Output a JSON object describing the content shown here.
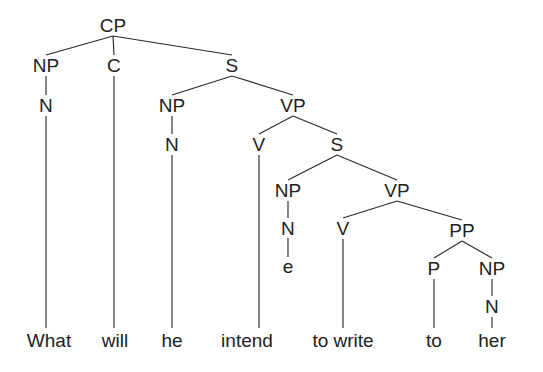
{
  "figure": {
    "kind": "syntax-tree",
    "sentence": "What will he intend to write to her",
    "line_color": "#2a2a2a",
    "text_color": "#222222",
    "background_color": "#ffffff"
  },
  "nodes": [
    {
      "id": "cp",
      "label": "CP",
      "x": 113,
      "y": 25
    },
    {
      "id": "np1",
      "label": "NP",
      "x": 46,
      "y": 65
    },
    {
      "id": "c",
      "label": "C",
      "x": 114,
      "y": 65
    },
    {
      "id": "s1",
      "label": "S",
      "x": 232,
      "y": 65
    },
    {
      "id": "n1",
      "label": "N",
      "x": 46,
      "y": 105
    },
    {
      "id": "np2",
      "label": "NP",
      "x": 172,
      "y": 105
    },
    {
      "id": "vp1",
      "label": "VP",
      "x": 293,
      "y": 105
    },
    {
      "id": "n2",
      "label": "N",
      "x": 172,
      "y": 144
    },
    {
      "id": "v1",
      "label": "V",
      "x": 259,
      "y": 144
    },
    {
      "id": "s2",
      "label": "S",
      "x": 337,
      "y": 144
    },
    {
      "id": "np3",
      "label": "NP",
      "x": 288,
      "y": 190
    },
    {
      "id": "vp2",
      "label": "VP",
      "x": 397,
      "y": 190
    },
    {
      "id": "n3",
      "label": "N",
      "x": 288,
      "y": 228
    },
    {
      "id": "v2",
      "label": "V",
      "x": 343,
      "y": 228
    },
    {
      "id": "pp",
      "label": "PP",
      "x": 462,
      "y": 230
    },
    {
      "id": "trace",
      "label": "e",
      "x": 288,
      "y": 266
    },
    {
      "id": "p",
      "label": "P",
      "x": 434,
      "y": 268
    },
    {
      "id": "np4",
      "label": "NP",
      "x": 492,
      "y": 268
    },
    {
      "id": "n4",
      "label": "N",
      "x": 492,
      "y": 306
    }
  ],
  "leaves": [
    {
      "id": "w-what",
      "label": "What",
      "x": 49,
      "y": 340
    },
    {
      "id": "w-will",
      "label": "will",
      "x": 115,
      "y": 340
    },
    {
      "id": "w-he",
      "label": "he",
      "x": 172,
      "y": 340
    },
    {
      "id": "w-intend",
      "label": "intend",
      "x": 247,
      "y": 340
    },
    {
      "id": "w-towrite",
      "label": "to write",
      "x": 343,
      "y": 340
    },
    {
      "id": "w-to",
      "label": "to",
      "x": 434,
      "y": 340
    },
    {
      "id": "w-her",
      "label": "her",
      "x": 492,
      "y": 340
    }
  ],
  "edges": [
    {
      "from": "cp",
      "to": "np1",
      "x1": 113,
      "y1": 36,
      "x2": 46,
      "y2": 55
    },
    {
      "from": "cp",
      "to": "c",
      "x1": 113,
      "y1": 36,
      "x2": 114,
      "y2": 55
    },
    {
      "from": "cp",
      "to": "s1",
      "x1": 113,
      "y1": 36,
      "x2": 232,
      "y2": 55
    },
    {
      "from": "np1",
      "to": "n1",
      "x1": 46,
      "y1": 76,
      "x2": 46,
      "y2": 95
    },
    {
      "from": "s1",
      "to": "np2",
      "x1": 232,
      "y1": 76,
      "x2": 172,
      "y2": 95
    },
    {
      "from": "s1",
      "to": "vp1",
      "x1": 232,
      "y1": 76,
      "x2": 293,
      "y2": 95
    },
    {
      "from": "np2",
      "to": "n2",
      "x1": 172,
      "y1": 116,
      "x2": 172,
      "y2": 134
    },
    {
      "from": "vp1",
      "to": "v1",
      "x1": 293,
      "y1": 116,
      "x2": 259,
      "y2": 134
    },
    {
      "from": "vp1",
      "to": "s2",
      "x1": 293,
      "y1": 116,
      "x2": 337,
      "y2": 134
    },
    {
      "from": "s2",
      "to": "np3",
      "x1": 337,
      "y1": 155,
      "x2": 288,
      "y2": 180
    },
    {
      "from": "s2",
      "to": "vp2",
      "x1": 337,
      "y1": 155,
      "x2": 397,
      "y2": 180
    },
    {
      "from": "np3",
      "to": "n3",
      "x1": 288,
      "y1": 201,
      "x2": 288,
      "y2": 218
    },
    {
      "from": "vp2",
      "to": "v2",
      "x1": 397,
      "y1": 201,
      "x2": 343,
      "y2": 218
    },
    {
      "from": "vp2",
      "to": "pp",
      "x1": 397,
      "y1": 201,
      "x2": 462,
      "y2": 220
    },
    {
      "from": "n3",
      "to": "trace",
      "x1": 288,
      "y1": 238,
      "x2": 288,
      "y2": 257
    },
    {
      "from": "pp",
      "to": "p",
      "x1": 462,
      "y1": 241,
      "x2": 434,
      "y2": 258
    },
    {
      "from": "pp",
      "to": "np4",
      "x1": 462,
      "y1": 241,
      "x2": 492,
      "y2": 258
    },
    {
      "from": "np4",
      "to": "n4",
      "x1": 492,
      "y1": 279,
      "x2": 492,
      "y2": 296
    },
    {
      "from": "n1",
      "to": "w-what",
      "x1": 46,
      "y1": 116,
      "x2": 46,
      "y2": 328
    },
    {
      "from": "c",
      "to": "w-will",
      "x1": 114,
      "y1": 76,
      "x2": 114,
      "y2": 328
    },
    {
      "from": "n2",
      "to": "w-he",
      "x1": 172,
      "y1": 155,
      "x2": 172,
      "y2": 328
    },
    {
      "from": "v1",
      "to": "w-intend",
      "x1": 259,
      "y1": 155,
      "x2": 259,
      "y2": 328
    },
    {
      "from": "v2",
      "to": "w-towrite",
      "x1": 343,
      "y1": 239,
      "x2": 343,
      "y2": 328
    },
    {
      "from": "p",
      "to": "w-to",
      "x1": 434,
      "y1": 279,
      "x2": 434,
      "y2": 328
    },
    {
      "from": "n4",
      "to": "w-her",
      "x1": 492,
      "y1": 317,
      "x2": 492,
      "y2": 328
    }
  ]
}
